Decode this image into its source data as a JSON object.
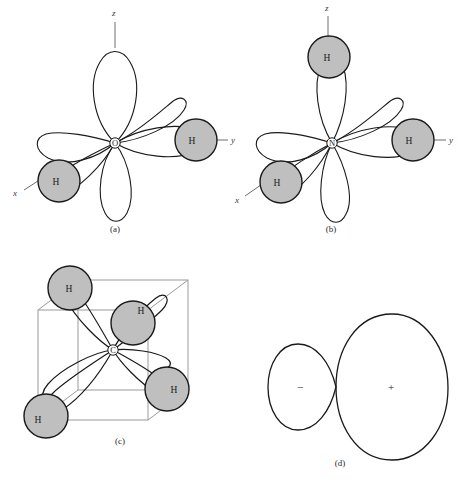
{
  "figure": {
    "background_color": "#ffffff",
    "line_color": "#1a1a1a",
    "atom_fill_color": "#bfbfbf",
    "atom_stroke_color": "#1a1a1a",
    "cube_line_color": "#9a9a9a",
    "axis_line_color": "#6e6e6e"
  },
  "panels": [
    {
      "id": "a",
      "caption": "(a)",
      "molecule": "water",
      "center_atom": "O",
      "hydrogens": [
        {
          "label": "H",
          "position": "lower-left"
        },
        {
          "label": "H",
          "position": "right"
        }
      ],
      "axes": [
        {
          "label": "z",
          "direction": "up"
        },
        {
          "label": "y",
          "direction": "right"
        },
        {
          "label": "x",
          "direction": "lower-left"
        }
      ],
      "lobe_count": 4
    },
    {
      "id": "b",
      "caption": "(b)",
      "molecule": "ammonia",
      "center_atom": "N",
      "hydrogens": [
        {
          "label": "H",
          "position": "top"
        },
        {
          "label": "H",
          "position": "lower-left"
        },
        {
          "label": "H",
          "position": "right"
        }
      ],
      "axes": [
        {
          "label": "z",
          "direction": "up"
        },
        {
          "label": "y",
          "direction": "right"
        },
        {
          "label": "x",
          "direction": "lower-left"
        }
      ],
      "lobe_count": 4
    },
    {
      "id": "c",
      "caption": "(c)",
      "molecule": "methane",
      "center_atom": "C",
      "hydrogens": [
        {
          "label": "H",
          "position": "upper-left-cube-corner"
        },
        {
          "label": "H",
          "position": "upper-right-cube-corner"
        },
        {
          "label": "H",
          "position": "lower-right-cube-corner"
        },
        {
          "label": "H",
          "position": "lower-left-cube-corner"
        }
      ],
      "has_cube": true,
      "lobe_count": 4
    },
    {
      "id": "d",
      "caption": "(d)",
      "molecule": "sp3 hybrid orbital",
      "lobes": [
        {
          "sign": "−",
          "size": "small",
          "position": "left"
        },
        {
          "sign": "+",
          "size": "large",
          "position": "right"
        }
      ]
    }
  ]
}
